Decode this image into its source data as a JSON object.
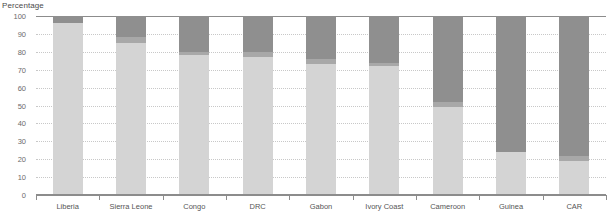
{
  "chart_data": {
    "type": "bar",
    "subtype": "stacked-bar-vertical-100",
    "title": "",
    "ylabel": "Percentage",
    "xlabel": "",
    "ylim": [
      0,
      100
    ],
    "yticks": [
      0,
      10,
      20,
      30,
      40,
      50,
      60,
      70,
      80,
      90,
      100
    ],
    "ytick_labels": [
      "0",
      "10",
      "20",
      "30",
      "40",
      "50",
      "60",
      "70",
      "80",
      "90",
      "100"
    ],
    "grid": true,
    "legend": "none",
    "categories": [
      "Liberia",
      "Sierra Leone",
      "Congo",
      "DRC",
      "Gabon",
      "Ivory Coast",
      "Cameroon",
      "Guinea",
      "CAR"
    ],
    "series": [
      {
        "name": "segment-light",
        "color": "#d4d4d4",
        "values": [
          96,
          85,
          78,
          77,
          73,
          72,
          49,
          24,
          19
        ]
      },
      {
        "name": "segment-medium",
        "color": "#a8a8a8",
        "values": [
          0,
          3,
          2,
          3,
          3,
          2,
          3,
          0,
          3
        ]
      },
      {
        "name": "segment-dark",
        "color": "#8f8f8f",
        "values": [
          4,
          12,
          20,
          20,
          24,
          26,
          48,
          76,
          78
        ]
      }
    ]
  },
  "colors": {
    "segment_light": "#d4d4d4",
    "segment_medium": "#a8a8a8",
    "segment_dark": "#8f8f8f",
    "gridline": "#c8c8c8",
    "axis": "#8c8c8c",
    "tick_text": "#6b6b6b",
    "label_text": "#555555",
    "title_text": "#4a4a4a",
    "background": "#ffffff"
  }
}
